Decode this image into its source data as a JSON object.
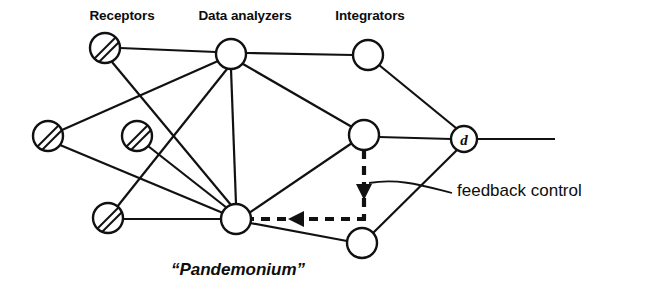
{
  "figure": {
    "background_color": "#ffffff",
    "stroke_color": "#111111"
  },
  "column_labels": [
    {
      "id": "receptors",
      "text": "Receptors",
      "x": 122,
      "y": 20
    },
    {
      "id": "data-analyzers",
      "text": "Data analyzers",
      "x": 245,
      "y": 20
    },
    {
      "id": "integrators",
      "text": "Integrators",
      "x": 370,
      "y": 20
    }
  ],
  "caption": {
    "text": "“Pandemonium”",
    "x": 238,
    "y": 275
  },
  "annotation": {
    "text": "feedback control",
    "x": 457,
    "y": 196
  },
  "nodes": [
    {
      "id": "receptor-1",
      "label": "",
      "type": "receptor",
      "hatched": true,
      "x": 105,
      "y": 48,
      "r": 15
    },
    {
      "id": "receptor-2",
      "label": "",
      "type": "receptor",
      "hatched": true,
      "x": 48,
      "y": 136,
      "r": 15
    },
    {
      "id": "receptor-3",
      "label": "",
      "type": "receptor",
      "hatched": true,
      "x": 137,
      "y": 136,
      "r": 15
    },
    {
      "id": "receptor-4",
      "label": "",
      "type": "receptor",
      "hatched": true,
      "x": 108,
      "y": 218,
      "r": 15
    },
    {
      "id": "analyzer-1",
      "label": "",
      "type": "analyzer",
      "hatched": false,
      "x": 231,
      "y": 54,
      "r": 15
    },
    {
      "id": "analyzer-2",
      "label": "",
      "type": "analyzer",
      "hatched": false,
      "x": 236,
      "y": 219,
      "r": 15
    },
    {
      "id": "integrator-1",
      "label": "",
      "type": "integrator",
      "hatched": false,
      "x": 368,
      "y": 55,
      "r": 15
    },
    {
      "id": "integrator-2",
      "label": "",
      "type": "integrator",
      "hatched": false,
      "x": 364,
      "y": 135,
      "r": 15
    },
    {
      "id": "integrator-3",
      "label": "",
      "type": "integrator",
      "hatched": false,
      "x": 362,
      "y": 243,
      "r": 15
    },
    {
      "id": "decision-node-d",
      "label": "d",
      "type": "decision",
      "hatched": false,
      "x": 464,
      "y": 139,
      "r": 13
    }
  ],
  "edges": [
    {
      "id": "edge-r1-a1",
      "from": "receptor-1",
      "to": "analyzer-1"
    },
    {
      "id": "edge-r1-a2",
      "from": "receptor-1",
      "to": "analyzer-2"
    },
    {
      "id": "edge-r2-a1",
      "from": "receptor-2",
      "to": "analyzer-1"
    },
    {
      "id": "edge-r2-a2",
      "from": "receptor-2",
      "to": "analyzer-2"
    },
    {
      "id": "edge-r3-a2",
      "from": "receptor-3",
      "to": "analyzer-2"
    },
    {
      "id": "edge-r4-a1",
      "from": "receptor-4",
      "to": "analyzer-1"
    },
    {
      "id": "edge-r4-a2",
      "from": "receptor-4",
      "to": "analyzer-2"
    },
    {
      "id": "edge-a1-i1",
      "from": "analyzer-1",
      "to": "integrator-1"
    },
    {
      "id": "edge-a1-i2",
      "from": "analyzer-1",
      "to": "integrator-2"
    },
    {
      "id": "edge-a1-a2",
      "from": "analyzer-1",
      "to": "analyzer-2"
    },
    {
      "id": "edge-a2-i2",
      "from": "analyzer-2",
      "to": "integrator-2"
    },
    {
      "id": "edge-a2-i3",
      "from": "analyzer-2",
      "to": "integrator-3"
    },
    {
      "id": "edge-i1-d",
      "from": "integrator-1",
      "to": "decision-node-d"
    },
    {
      "id": "edge-i2-d",
      "from": "integrator-2",
      "to": "decision-node-d"
    },
    {
      "id": "edge-i3-d",
      "from": "integrator-3",
      "to": "decision-node-d"
    }
  ],
  "output_line": {
    "id": "output-line",
    "from_x": 477,
    "to_x": 555,
    "y": 139
  },
  "feedback_path": {
    "id": "feedback-dashed-path",
    "description": "dashed feedback control path from integrator-2 down then left to analyzer-2",
    "vertical": {
      "x": 364,
      "y_from": 150,
      "y_to": 219
    },
    "horizontal": {
      "y": 219,
      "x_from": 364,
      "x_to": 252
    },
    "arrow_down_at": {
      "x": 364,
      "y": 192
    },
    "arrow_left_at": {
      "x": 299,
      "y": 219
    }
  },
  "leader_line": {
    "id": "feedback-leader",
    "start_x": 369,
    "start_y": 183,
    "end_x": 452,
    "end_y": 192
  }
}
